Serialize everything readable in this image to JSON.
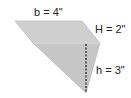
{
  "diagram": {
    "type": "geometric-shape",
    "shape": "parallelogram with attached triangle",
    "labels": {
      "base": "b = 4\"",
      "parallelogram_height": "H = 2\"",
      "triangle_height": "h = 3\""
    },
    "colors": {
      "fill_top": "#cfcfcf",
      "fill_bottom": "#c4c4c4",
      "edge": "#a8a8a8",
      "divider": "#e6e6e6",
      "dashed_line": "#222222"
    }
  }
}
